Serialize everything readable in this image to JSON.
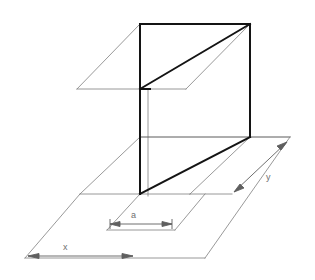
{
  "figure": {
    "title": "",
    "type": "technical-line-diagram",
    "background_color": "#ffffff",
    "line_color_bold": "#1a1a1a",
    "line_color_thin": "#7a7a7a",
    "label_color": "#6f6f6f"
  },
  "labels": {
    "a": "a",
    "x": "x",
    "y": "y"
  },
  "dimensions": [
    {
      "name": "a",
      "label": "a",
      "orientation": "horizontal",
      "arrows": "both"
    },
    {
      "name": "x",
      "label": "x",
      "orientation": "horizontal",
      "arrows": "both"
    },
    {
      "name": "y",
      "label": "y",
      "orientation": "diagonal",
      "arrows": "both"
    }
  ],
  "geometry": {
    "panel_top_edge": [
      [
        140,
        24
      ],
      [
        250,
        24
      ]
    ],
    "panel_left_edge": [
      [
        140,
        24
      ],
      [
        140,
        194
      ]
    ],
    "panel_right_edge": [
      [
        250,
        24
      ],
      [
        250,
        137
      ]
    ],
    "panel_bottom_edge": [
      [
        140,
        137
      ],
      [
        250,
        137
      ]
    ],
    "upper_plane": [
      [
        77,
        89
      ],
      [
        140,
        24
      ],
      [
        250,
        24
      ],
      [
        186,
        89
      ]
    ],
    "ground_plane": [
      [
        80,
        194
      ],
      [
        140,
        137
      ],
      [
        250,
        137
      ],
      [
        190,
        194
      ]
    ],
    "bold_diagonal_upper": [
      [
        140,
        89
      ],
      [
        250,
        24
      ]
    ],
    "bold_diagonal_lower": [
      [
        140,
        194
      ],
      [
        250,
        137
      ]
    ]
  }
}
